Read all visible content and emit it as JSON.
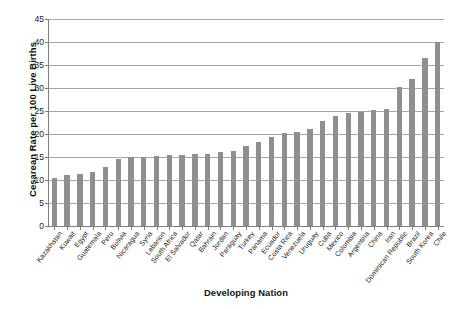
{
  "chart_data": {
    "type": "bar",
    "title": "",
    "xlabel": "Developing Nation",
    "ylabel": "Cesarean Rate per 100 Live Births",
    "ylim": [
      0,
      45
    ],
    "ytick_step": 5,
    "yticks": [
      0,
      5,
      10,
      15,
      20,
      25,
      30,
      35,
      40,
      45
    ],
    "grid": "horizontal",
    "legend": "none",
    "bar_color": "#8f8f8f",
    "categories": [
      "Kazakhstan",
      "Kuwait",
      "Egypt",
      "Guatemala",
      "Peru",
      "Bolivia",
      "Nicaragua",
      "Syria",
      "Lebanon",
      "South Africa",
      "El Salvador",
      "Qatar",
      "Bahrain",
      "Jordan",
      "Paraguay",
      "Turkey",
      "Panama",
      "Ecuador",
      "Costa Rica",
      "Venezuela",
      "Uruguay",
      "Cuba",
      "Mexico",
      "Colombia",
      "Argentina",
      "China",
      "Iran",
      "Dominican Republic",
      "Brazil",
      "South Korea",
      "Chile"
    ],
    "values": [
      10.5,
      11.0,
      11.3,
      11.7,
      12.8,
      14.5,
      15.0,
      15.1,
      15.2,
      15.4,
      15.5,
      15.6,
      15.7,
      16.0,
      16.2,
      17.5,
      18.2,
      19.3,
      20.2,
      20.5,
      21.0,
      22.8,
      24.0,
      24.5,
      24.8,
      25.3,
      25.5,
      30.3,
      32.0,
      36.5,
      40.0
    ]
  }
}
